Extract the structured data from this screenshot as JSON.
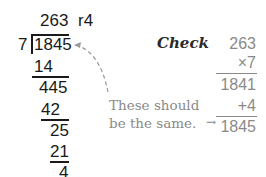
{
  "long_division": {
    "quotient": "263",
    "remainder": "r4",
    "divisor": "7",
    "dividend": "1845",
    "steps": [
      "14",
      "445",
      "42",
      "25",
      "21",
      "4"
    ]
  },
  "check": {
    "heading": "Check",
    "multiplicand": "263",
    "multiplier": "×7",
    "product": "1841",
    "addend": "+4",
    "total": "1845"
  },
  "annotation": {
    "line1": "These should",
    "line2": "be the same.",
    "arrow": "←"
  },
  "colors": {
    "main_text": "#1a1a1a",
    "check_text": "#8a8a8a"
  }
}
